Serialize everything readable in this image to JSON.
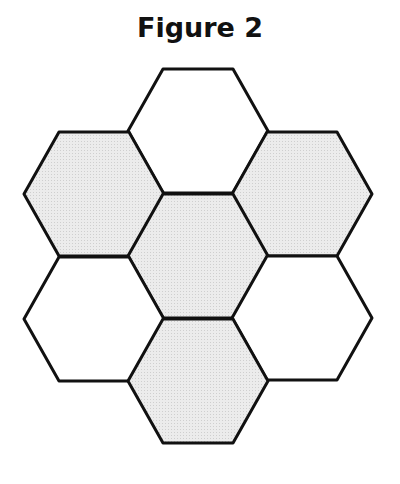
{
  "title": "Figure 2",
  "colors": {
    "stroke": "#111111",
    "shaded_fill": "#e4e4e4",
    "unshaded_fill": "#ffffff"
  },
  "hexagons": [
    {
      "name": "top",
      "cx": 198,
      "cy": 131,
      "shaded": false
    },
    {
      "name": "upper-left",
      "cx": 94,
      "cy": 194,
      "shaded": true
    },
    {
      "name": "upper-right",
      "cx": 302,
      "cy": 194,
      "shaded": true
    },
    {
      "name": "center",
      "cx": 198,
      "cy": 256,
      "shaded": true
    },
    {
      "name": "lower-left",
      "cx": 94,
      "cy": 319,
      "shaded": false
    },
    {
      "name": "lower-right",
      "cx": 302,
      "cy": 318,
      "shaded": false
    },
    {
      "name": "bottom",
      "cx": 198,
      "cy": 381,
      "shaded": true
    }
  ],
  "hex_geometry": {
    "half_width": 70,
    "half_height": 62,
    "half_top": 35
  }
}
